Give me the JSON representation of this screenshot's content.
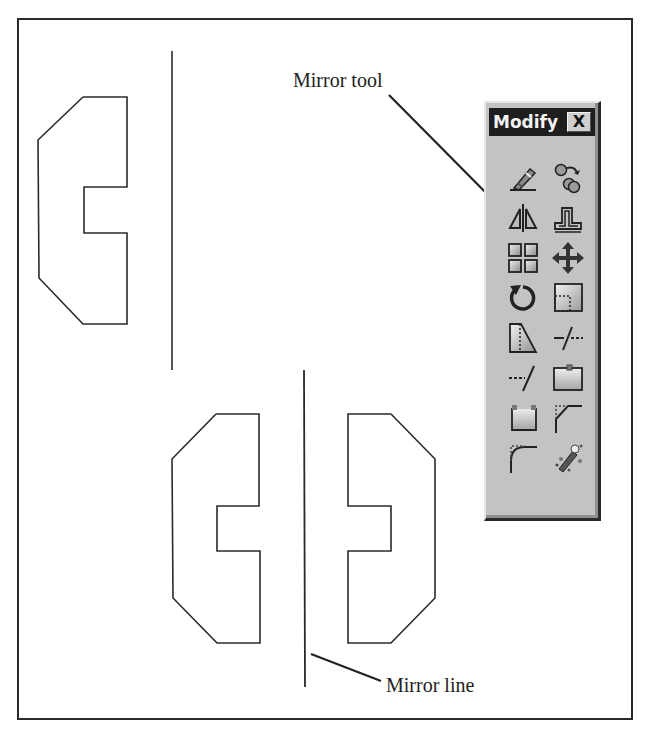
{
  "figure": {
    "callouts": {
      "mirror_tool": "Mirror tool",
      "mirror_line": "Mirror line"
    },
    "drawing": {
      "original_shape": "closed polyline profile with chamfered corners and rectangular notch",
      "original_mirror_line": "vertical line right of original",
      "result": "original shape plus mirrored copy about vertical mirror line"
    }
  },
  "toolbar": {
    "title": "Modify",
    "close_label": "X",
    "tools": [
      {
        "name": "Erase",
        "icon": "eraser-icon"
      },
      {
        "name": "Copy",
        "icon": "copy-icon"
      },
      {
        "name": "Mirror",
        "icon": "mirror-icon"
      },
      {
        "name": "Offset",
        "icon": "offset-icon"
      },
      {
        "name": "Array",
        "icon": "array-icon"
      },
      {
        "name": "Move",
        "icon": "move-icon"
      },
      {
        "name": "Rotate",
        "icon": "rotate-icon"
      },
      {
        "name": "Scale",
        "icon": "scale-icon"
      },
      {
        "name": "Stretch",
        "icon": "stretch-icon"
      },
      {
        "name": "Trim",
        "icon": "trim-icon"
      },
      {
        "name": "Extend",
        "icon": "extend-icon"
      },
      {
        "name": "Break at Point",
        "icon": "break-at-point-icon"
      },
      {
        "name": "Break",
        "icon": "break-icon"
      },
      {
        "name": "Chamfer",
        "icon": "chamfer-icon"
      },
      {
        "name": "Fillet",
        "icon": "fillet-icon"
      },
      {
        "name": "Explode",
        "icon": "explode-icon"
      }
    ]
  },
  "colors": {
    "line": "#2a2a2a",
    "panel_bg": "#c3c3c3",
    "titlebar_bg": "#1e1e1e"
  }
}
